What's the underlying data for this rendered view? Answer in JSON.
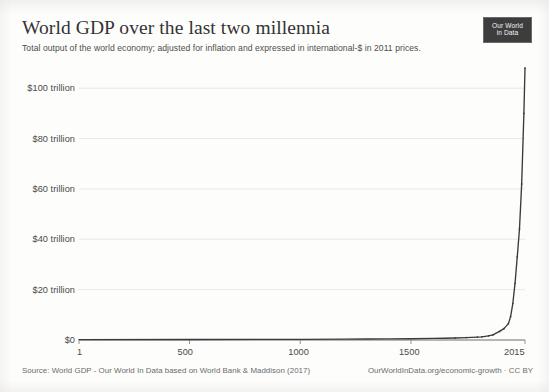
{
  "header": {
    "title": "World GDP over the last two millennia",
    "subtitle": "Total output of the world economy; adjusted for inflation and expressed in international-$ in 2011 prices.",
    "logo_line1": "Our World",
    "logo_line2": "in Data"
  },
  "footer": {
    "source": "Source: World GDP - Our World In Data based on World Bank & Maddison (2017)",
    "attribution": "OurWorldInData.org/economic-growth · CC BY"
  },
  "chart_data": {
    "type": "line",
    "title": "World GDP over the last two millennia",
    "subtitle": "Total output of the world economy; adjusted for inflation and expressed in international-$ in 2011 prices.",
    "xlabel": "",
    "ylabel": "",
    "xlim": [
      1,
      2015
    ],
    "ylim": [
      0,
      112
    ],
    "y_unit": "trillion international-$ (2011 prices)",
    "grid": "horizontal",
    "legend": "none",
    "xticks": [
      1,
      500,
      1000,
      1500,
      2015
    ],
    "xtick_labels": [
      "1",
      "500",
      "1000",
      "1500",
      "2015"
    ],
    "yticks": [
      0,
      20,
      40,
      60,
      80,
      100
    ],
    "ytick_labels": [
      "$0",
      "$20 trillion",
      "$40 trillion",
      "$60 trillion",
      "$80 trillion",
      "$100 trillion"
    ],
    "series": [
      {
        "name": "World GDP",
        "color": "#3b3b3b",
        "x": [
          1,
          500,
          800,
          1000,
          1200,
          1300,
          1400,
          1500,
          1600,
          1650,
          1700,
          1750,
          1800,
          1820,
          1850,
          1870,
          1900,
          1920,
          1940,
          1950,
          1960,
          1970,
          1980,
          1990,
          2000,
          2010,
          2015
        ],
        "values": [
          0.18,
          0.21,
          0.24,
          0.27,
          0.35,
          0.39,
          0.43,
          0.51,
          0.63,
          0.7,
          0.8,
          0.95,
          1.17,
          1.25,
          1.65,
          2.0,
          3.4,
          4.5,
          6.5,
          9.3,
          14.5,
          22.5,
          33.0,
          44.0,
          62.0,
          90.0,
          108.0
        ]
      }
    ],
    "annotations": []
  }
}
